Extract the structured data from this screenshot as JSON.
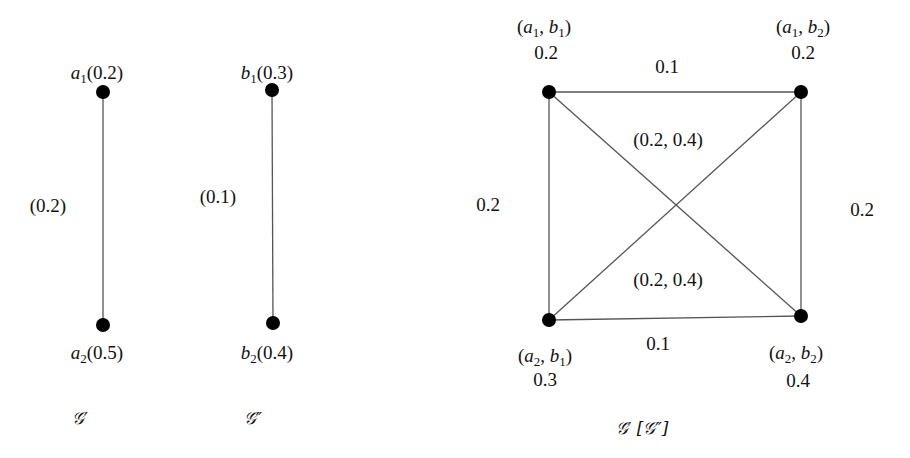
{
  "graphs": {
    "g1": {
      "caption": "𝒢′",
      "nodes": [
        {
          "id": "a1",
          "name": "a",
          "sub": "1",
          "value": "(0.2)",
          "x": 103,
          "y": 92,
          "lx": 97,
          "ly": 72
        },
        {
          "id": "a2",
          "name": "a",
          "sub": "2",
          "value": "(0.5)",
          "x": 103,
          "y": 325,
          "lx": 97,
          "ly": 352
        }
      ],
      "edges": [
        {
          "from": "a1",
          "to": "a2",
          "label": "(0.2)",
          "lx": 48,
          "ly": 205
        }
      ],
      "caption_pos": {
        "x": 80,
        "y": 418
      }
    },
    "g2": {
      "caption": "𝒢″",
      "nodes": [
        {
          "id": "b1",
          "name": "b",
          "sub": "1",
          "value": "(0.3)",
          "x": 272,
          "y": 90,
          "lx": 267,
          "ly": 72
        },
        {
          "id": "b2",
          "name": "b",
          "sub": "2",
          "value": "(0.4)",
          "x": 273,
          "y": 323,
          "lx": 267,
          "ly": 352
        }
      ],
      "edges": [
        {
          "from": "b1",
          "to": "b2",
          "label": "(0.1)",
          "lx": 218,
          "ly": 196
        }
      ],
      "caption_pos": {
        "x": 253,
        "y": 418
      }
    },
    "product": {
      "caption": "𝒢′ [𝒢″]",
      "nodes": [
        {
          "id": "a1b1",
          "label": "(a1, b1)",
          "a": "1",
          "b": "1",
          "value": "0.2",
          "x": 549,
          "y": 92,
          "lx": 544,
          "ly": 26,
          "vx": 546,
          "vy": 52
        },
        {
          "id": "a1b2",
          "label": "(a1, b2)",
          "a": "1",
          "b": "2",
          "value": "0.2",
          "x": 801,
          "y": 92,
          "lx": 803,
          "ly": 26,
          "vx": 803,
          "vy": 52
        },
        {
          "id": "a2b1",
          "label": "(a2, b1)",
          "a": "2",
          "b": "1",
          "value": "0.3",
          "x": 549,
          "y": 320,
          "lx": 545,
          "ly": 355,
          "vx": 545,
          "vy": 379
        },
        {
          "id": "a2b2",
          "label": "(a2, b2)",
          "a": "2",
          "b": "2",
          "value": "0.4",
          "x": 801,
          "y": 316,
          "lx": 796,
          "ly": 352,
          "vx": 798,
          "vy": 380
        }
      ],
      "edges": [
        {
          "from": "a1b1",
          "to": "a1b2",
          "label": "0.1",
          "lx": 667,
          "ly": 66
        },
        {
          "from": "a2b1",
          "to": "a2b2",
          "label": "0.1",
          "lx": 658,
          "ly": 343
        },
        {
          "from": "a1b1",
          "to": "a2b1",
          "label": "0.2",
          "lx": 488,
          "ly": 204
        },
        {
          "from": "a1b2",
          "to": "a2b2",
          "label": "0.2",
          "lx": 862,
          "ly": 209
        },
        {
          "from": "a1b1",
          "to": "a2b2",
          "label": "(0.2, 0.4)",
          "lx": 668,
          "ly": 139
        },
        {
          "from": "a1b2",
          "to": "a2b1",
          "label": "(0.2, 0.4)",
          "lx": 668,
          "ly": 279
        }
      ],
      "caption_pos": {
        "x": 642,
        "y": 428
      }
    }
  },
  "style": {
    "node_color": "#000000",
    "edge_color": "#555555",
    "node_radius": 7
  }
}
